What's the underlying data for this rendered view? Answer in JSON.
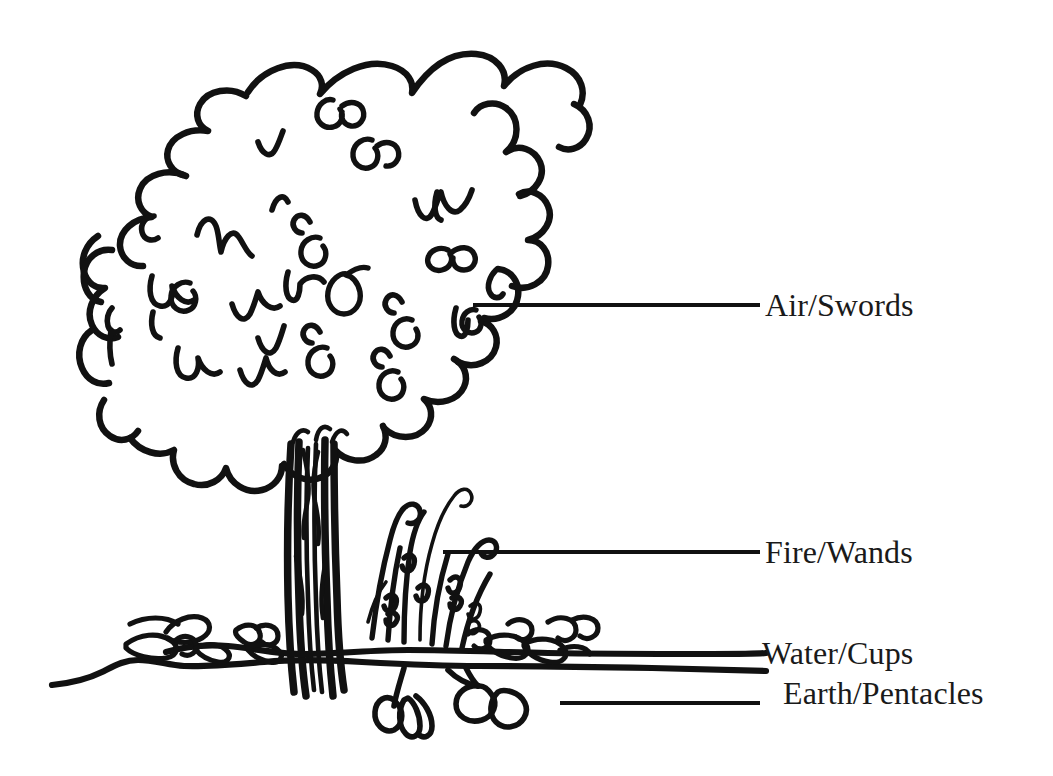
{
  "figure": {
    "kind": "hand-drawn-diagram",
    "background_color": "#ffffff",
    "ink_color": "#111111"
  },
  "labels": [
    {
      "id": "air",
      "text": "Air/Swords",
      "icon": "leader-line-icon"
    },
    {
      "id": "fire",
      "text": "Fire/Wands",
      "icon": "leader-line-icon"
    },
    {
      "id": "water",
      "text": "Water/Cups",
      "icon": "leader-line-icon"
    },
    {
      "id": "earth",
      "text": "Earth/Pentacles",
      "icon": "leader-line-icon"
    }
  ],
  "parts": {
    "canopy": "Air/Swords",
    "grass": "Fire/Wands",
    "ground_plants": "Water/Cups",
    "roots": "Earth/Pentacles"
  }
}
